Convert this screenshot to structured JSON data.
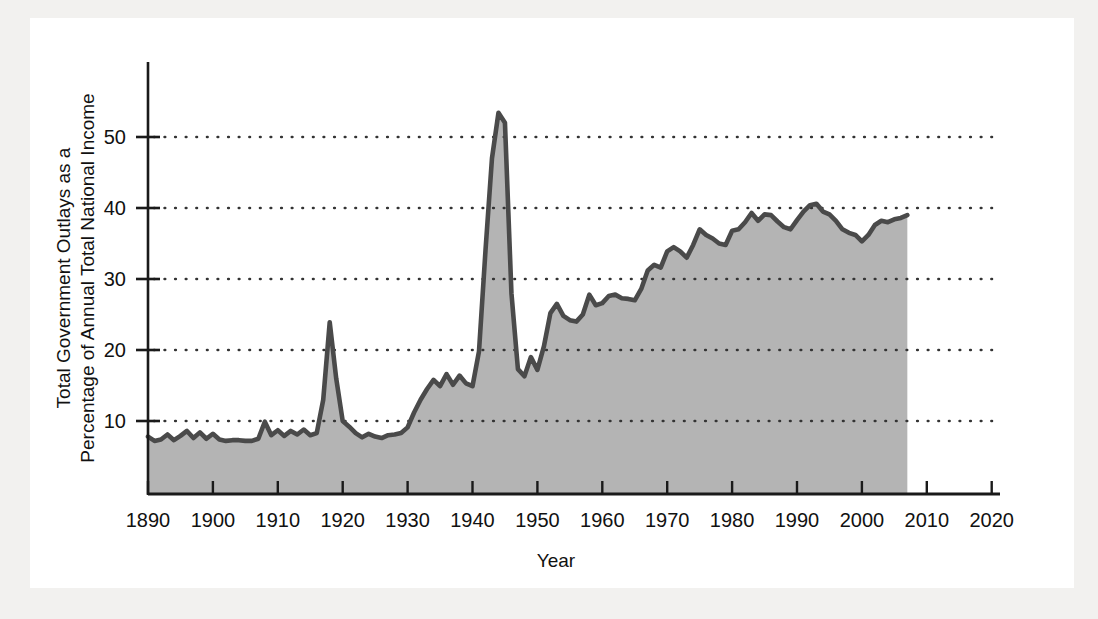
{
  "figure": {
    "background_color": "#f2f1ef",
    "page_color": "#ffffff",
    "line_color": "#4a4a4a",
    "fill_color": "#b4b4b4",
    "axis_color": "#1a1a1a",
    "grid_color": "#333333"
  },
  "labels": {
    "ylabel_line1": "Total Government Outlays as a",
    "ylabel_line2": "Percentage of Annual Total National Income",
    "xlabel": "Year"
  },
  "chart_data": {
    "type": "area",
    "title": "",
    "subtitle": "",
    "xlabel": "Year",
    "ylabel": "Total Government Outlays as a Percentage of Annual Total National Income",
    "xlim": [
      1890,
      2025
    ],
    "ylim": [
      0,
      57
    ],
    "xticks": [
      1890,
      1900,
      1910,
      1920,
      1930,
      1940,
      1950,
      1960,
      1970,
      1980,
      1990,
      2000,
      2010,
      2020
    ],
    "xticklabels": [
      "1890",
      "1900",
      "1910",
      "1920",
      "1930",
      "1940",
      "1950",
      "1960",
      "1970",
      "1980",
      "1990",
      "2000",
      "2010",
      "2020"
    ],
    "yticks": [
      10,
      20,
      30,
      40,
      50
    ],
    "yticklabels": [
      "10",
      "20",
      "30",
      "40",
      "50"
    ],
    "grid": "horizontal-dotted",
    "legend": "none",
    "series": [
      {
        "name": "Total Government Outlays as % of National Income",
        "x": [
          1890,
          1891,
          1892,
          1893,
          1894,
          1895,
          1896,
          1897,
          1898,
          1899,
          1900,
          1901,
          1902,
          1903,
          1904,
          1905,
          1906,
          1907,
          1908,
          1909,
          1910,
          1911,
          1912,
          1913,
          1914,
          1915,
          1916,
          1917,
          1918,
          1919,
          1920,
          1921,
          1922,
          1923,
          1924,
          1925,
          1926,
          1927,
          1928,
          1929,
          1930,
          1931,
          1932,
          1933,
          1934,
          1935,
          1936,
          1937,
          1938,
          1939,
          1940,
          1941,
          1942,
          1943,
          1944,
          1945,
          1946,
          1947,
          1948,
          1949,
          1950,
          1951,
          1952,
          1953,
          1954,
          1955,
          1956,
          1957,
          1958,
          1959,
          1960,
          1961,
          1962,
          1963,
          1964,
          1965,
          1966,
          1967,
          1968,
          1969,
          1970,
          1971,
          1972,
          1973,
          1974,
          1975,
          1976,
          1977,
          1978,
          1979,
          1980,
          1981,
          1982,
          1983,
          1984,
          1985,
          1986,
          1987,
          1988,
          1989,
          1990,
          1991,
          1992,
          1993,
          1994,
          1995,
          1996,
          1997,
          1998,
          1999,
          2000,
          2001,
          2002,
          2003,
          2004,
          2005,
          2006,
          2007
        ],
        "values": [
          7.8,
          7.2,
          7.4,
          8.1,
          7.3,
          7.9,
          8.6,
          7.6,
          8.4,
          7.5,
          8.2,
          7.4,
          7.2,
          7.3,
          7.3,
          7.2,
          7.2,
          7.5,
          9.9,
          8.0,
          8.7,
          7.9,
          8.6,
          8.1,
          8.8,
          8.0,
          8.3,
          13.0,
          23.9,
          16.0,
          10.0,
          9.2,
          8.3,
          7.7,
          8.2,
          7.8,
          7.6,
          8.0,
          8.1,
          8.3,
          9.1,
          11.2,
          13.0,
          14.5,
          15.8,
          14.9,
          16.6,
          15.1,
          16.4,
          15.3,
          14.9,
          19.8,
          34.0,
          47.0,
          53.4,
          52.0,
          28.0,
          17.3,
          16.3,
          19.0,
          17.2,
          20.5,
          25.2,
          26.5,
          24.8,
          24.2,
          24.0,
          25.0,
          27.8,
          26.3,
          26.6,
          27.6,
          27.8,
          27.3,
          27.2,
          27.0,
          28.6,
          31.2,
          32.0,
          31.6,
          33.9,
          34.5,
          33.9,
          33.0,
          34.8,
          37.0,
          36.2,
          35.7,
          35.0,
          34.8,
          36.8,
          37.0,
          38.0,
          39.3,
          38.2,
          39.1,
          39.0,
          38.1,
          37.3,
          37.0,
          38.3,
          39.5,
          40.4,
          40.6,
          39.5,
          39.1,
          38.2,
          37.0,
          36.5,
          36.2,
          35.3,
          36.2,
          37.6,
          38.2,
          38.0,
          38.4,
          38.6,
          39.0
        ]
      }
    ]
  }
}
